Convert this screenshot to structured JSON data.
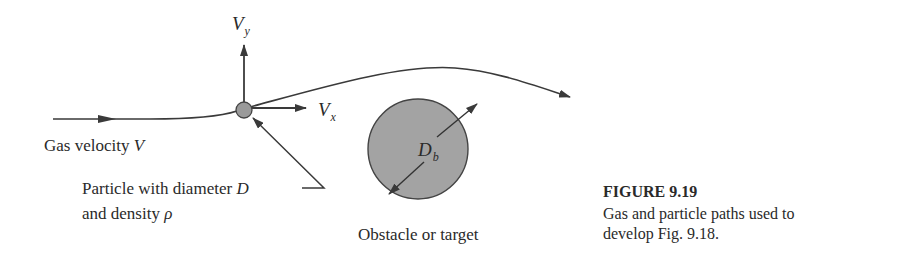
{
  "figure": {
    "number_label": "FIGURE 9.19",
    "caption_line1": "Gas and particle paths used to",
    "caption_line2": "develop Fig. 9.18."
  },
  "labels": {
    "gas_velocity_text": "Gas velocity ",
    "gas_velocity_symbol": "V",
    "vy_main": "V",
    "vy_sub": "y",
    "vx_main": "V",
    "vx_sub": "x",
    "db_main": "D",
    "db_sub": "b",
    "particle_line1_text": "Particle with diameter ",
    "particle_line1_symbol": "D",
    "particle_line2_text": "and density ",
    "particle_line2_symbol": "ρ",
    "obstacle": "Obstacle or target"
  },
  "colors": {
    "line": "#3a3a3a",
    "particle_fill": "#9a9a9a",
    "obstacle_fill": "#a3a3a3",
    "text": "#2a2a2a"
  },
  "icons": {
    "particle": "circle-particle-icon",
    "obstacle": "circle-obstacle-icon",
    "arrowheads": "arrowhead-icon"
  }
}
